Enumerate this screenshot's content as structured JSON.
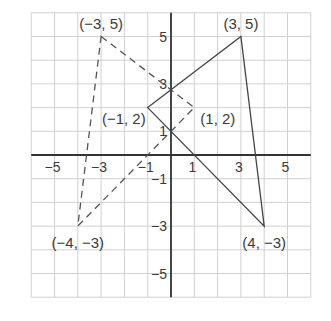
{
  "diagram": {
    "type": "coordinate-plane",
    "x_range": [
      -6,
      6
    ],
    "y_range": [
      -6,
      6
    ],
    "grid_step": 1,
    "x_tick_labels": [
      "-5",
      "-3",
      "-1",
      "1",
      "3",
      "5"
    ],
    "y_tick_labels": [
      "5",
      "3",
      "1",
      "-1",
      "-3",
      "-5"
    ],
    "colors": {
      "grid": "#d0d0d0",
      "axis": "#333333",
      "solid_shape": "#444444",
      "dashed_shape": "#555555",
      "text": "#3a3a3a"
    },
    "solid_triangle": {
      "style": "solid",
      "vertices": [
        [
          -1,
          2
        ],
        [
          3,
          5
        ],
        [
          4,
          -3
        ]
      ],
      "labels": [
        "(−1, 2)",
        "(3, 5)",
        "(4, −3)"
      ]
    },
    "dashed_triangle": {
      "style": "dashed",
      "vertices": [
        [
          -3,
          5
        ],
        [
          1,
          2
        ],
        [
          -4,
          -3
        ]
      ],
      "labels": [
        "(−3, 5)",
        "(1, 2)",
        "(−4, −3)"
      ]
    }
  }
}
